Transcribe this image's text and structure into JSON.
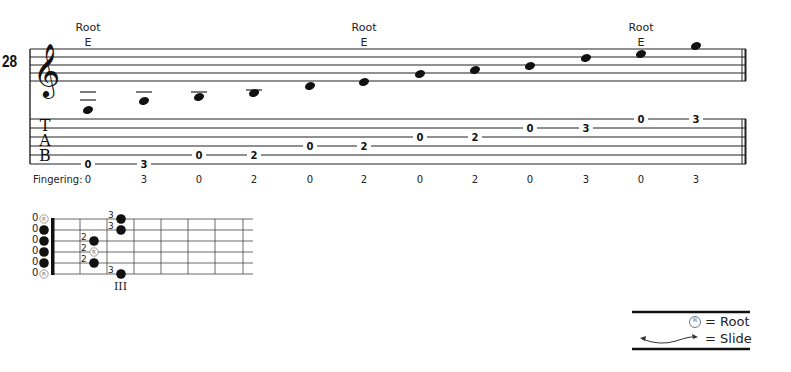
{
  "measure_number": "28",
  "clef": "treble-clef",
  "tab_label": [
    "T",
    "A",
    "B"
  ],
  "root_markers": [
    {
      "label": "Root",
      "note": "E",
      "x": 88
    },
    {
      "label": "Root",
      "note": "E",
      "x": 364
    },
    {
      "label": "Root",
      "note": "E",
      "x": 641
    }
  ],
  "notes": [
    {
      "pitch": "E3",
      "x": 88,
      "y": 110,
      "ledger_lines": [
        92,
        100
      ],
      "tab_string": 6,
      "fret": "0",
      "finger": "0"
    },
    {
      "pitch": "F3",
      "x": 144,
      "y": 101,
      "ledger_lines": [
        92
      ],
      "tab_string": 6,
      "fret": "3",
      "finger": "3"
    },
    {
      "pitch": "A3",
      "x": 199,
      "y": 97,
      "ledger_lines": [
        92
      ],
      "tab_string": 5,
      "fret": "0",
      "finger": "0"
    },
    {
      "pitch": "B3",
      "x": 254,
      "y": 93,
      "ledger_lines": [
        90
      ],
      "tab_string": 5,
      "fret": "2",
      "finger": "2"
    },
    {
      "pitch": "D4",
      "x": 310,
      "y": 86,
      "ledger_lines": [],
      "tab_string": 4,
      "fret": "0",
      "finger": "0"
    },
    {
      "pitch": "E4",
      "x": 364,
      "y": 82,
      "ledger_lines": [],
      "tab_string": 4,
      "fret": "2",
      "finger": "2"
    },
    {
      "pitch": "G4",
      "x": 420,
      "y": 74,
      "ledger_lines": [],
      "tab_string": 3,
      "fret": "0",
      "finger": "0"
    },
    {
      "pitch": "A4",
      "x": 475,
      "y": 70,
      "ledger_lines": [],
      "tab_string": 3,
      "fret": "2",
      "finger": "2"
    },
    {
      "pitch": "B4",
      "x": 530,
      "y": 66,
      "ledger_lines": [],
      "tab_string": 2,
      "fret": "0",
      "finger": "0"
    },
    {
      "pitch": "D5",
      "x": 586,
      "y": 58,
      "ledger_lines": [],
      "tab_string": 2,
      "fret": "3",
      "finger": "3"
    },
    {
      "pitch": "E5",
      "x": 641,
      "y": 54,
      "ledger_lines": [],
      "tab_string": 1,
      "fret": "0",
      "finger": "0"
    },
    {
      "pitch": "G5",
      "x": 696,
      "y": 46,
      "ledger_lines": [],
      "tab_string": 1,
      "fret": "3",
      "finger": "3"
    }
  ],
  "fingering_label": "Fingering:",
  "fretboard": {
    "open_labels": [
      "0",
      "0",
      "0",
      "0",
      "0",
      "0"
    ],
    "open_markers": [
      "root",
      "dot",
      "dot",
      "dot",
      "dot",
      "root"
    ],
    "fretted": [
      {
        "string": 1,
        "fret": 3,
        "finger": "3",
        "marker": "dot"
      },
      {
        "string": 2,
        "fret": 3,
        "finger": "3",
        "marker": "dot"
      },
      {
        "string": 3,
        "fret": 2,
        "finger": "2",
        "marker": "dot"
      },
      {
        "string": 4,
        "fret": 2,
        "finger": "2",
        "marker": "root"
      },
      {
        "string": 5,
        "fret": 2,
        "finger": "2",
        "marker": "dot"
      },
      {
        "string": 6,
        "fret": 3,
        "finger": "3",
        "marker": "dot"
      }
    ],
    "position_label": "III"
  },
  "legend": {
    "root_symbol": "R",
    "root_text": "= Root",
    "slide_text": "= Slide"
  }
}
